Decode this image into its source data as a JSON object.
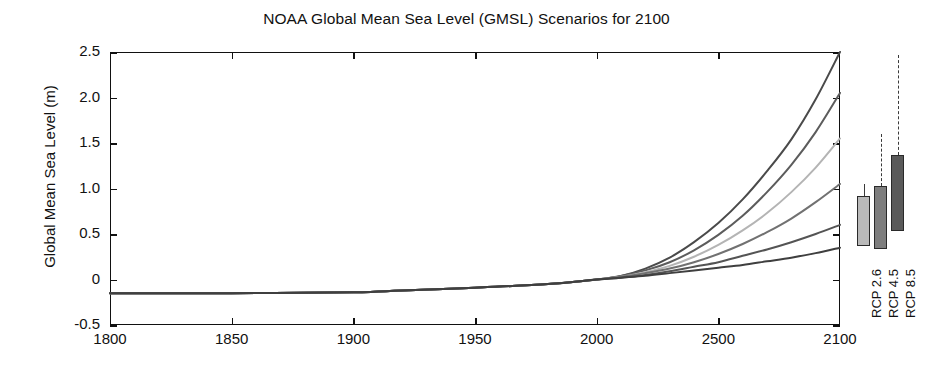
{
  "chart_data": {
    "type": "line",
    "title": "NOAA Global Mean Sea Level (GMSL) Scenarios for 2100",
    "xlabel": "",
    "ylabel": "Global Mean Sea Level (m)",
    "xlim": [
      1800,
      2100
    ],
    "ylim": [
      -0.5,
      2.5
    ],
    "grid": false,
    "legend_position": "none",
    "xticks": [
      "1800",
      "1850",
      "1900",
      "1950",
      "2000",
      "2500",
      "2100"
    ],
    "xtick_values": [
      1800,
      1850,
      1900,
      1950,
      2000,
      2050,
      2100
    ],
    "yticks": [
      "2.5",
      "2.0",
      "1.5",
      "1.0",
      "0.5",
      "0",
      "-0.5"
    ],
    "ytick_values": [
      2.5,
      2.0,
      1.5,
      1.0,
      0.5,
      0,
      -0.5
    ],
    "x": [
      1800,
      1850,
      1900,
      1920,
      1950,
      1980,
      2000,
      2010,
      2020,
      2030,
      2040,
      2050,
      2060,
      2070,
      2080,
      2090,
      2100
    ],
    "series": [
      {
        "name": "Extreme",
        "color": "#4a4a4a",
        "values": [
          -0.15,
          -0.15,
          -0.14,
          -0.12,
          -0.09,
          -0.05,
          0.0,
          0.04,
          0.12,
          0.24,
          0.41,
          0.62,
          0.88,
          1.19,
          1.54,
          1.98,
          2.5
        ]
      },
      {
        "name": "High",
        "color": "#5c5c5c",
        "values": [
          -0.15,
          -0.15,
          -0.14,
          -0.12,
          -0.09,
          -0.05,
          0.0,
          0.04,
          0.1,
          0.19,
          0.32,
          0.49,
          0.7,
          0.96,
          1.26,
          1.62,
          2.05
        ]
      },
      {
        "name": "Intermediate-High",
        "color": "#b4b4b4",
        "values": [
          -0.15,
          -0.15,
          -0.14,
          -0.12,
          -0.09,
          -0.05,
          0.0,
          0.03,
          0.08,
          0.15,
          0.25,
          0.38,
          0.54,
          0.73,
          0.96,
          1.23,
          1.55
        ]
      },
      {
        "name": "Intermediate",
        "color": "#717171",
        "values": [
          -0.15,
          -0.15,
          -0.14,
          -0.12,
          -0.09,
          -0.05,
          0.0,
          0.03,
          0.07,
          0.12,
          0.19,
          0.28,
          0.39,
          0.52,
          0.67,
          0.85,
          1.05
        ]
      },
      {
        "name": "Intermediate-Low",
        "color": "#545454",
        "values": [
          -0.15,
          -0.15,
          -0.14,
          -0.12,
          -0.09,
          -0.05,
          0.0,
          0.02,
          0.05,
          0.09,
          0.14,
          0.19,
          0.26,
          0.33,
          0.41,
          0.5,
          0.6
        ]
      },
      {
        "name": "Low",
        "color": "#3f3f3f",
        "values": [
          -0.15,
          -0.15,
          -0.14,
          -0.12,
          -0.09,
          -0.05,
          0.0,
          0.02,
          0.04,
          0.07,
          0.1,
          0.13,
          0.16,
          0.2,
          0.24,
          0.29,
          0.35
        ]
      }
    ],
    "bars": [
      {
        "label": "RCP 2.6",
        "color": "#b9b9b9",
        "box_low": 0.37,
        "box_high": 0.92,
        "whisker_high": 1.05,
        "whisker_style": "solid"
      },
      {
        "label": "RCP 4.5",
        "color": "#7e7e7e",
        "box_low": 0.33,
        "box_high": 1.03,
        "whisker_high": 1.6,
        "whisker_style": "dashed"
      },
      {
        "label": "RCP 8.5",
        "color": "#5a5a5a",
        "box_low": 0.53,
        "box_high": 1.37,
        "whisker_high": 2.47,
        "whisker_style": "dashed"
      }
    ]
  }
}
